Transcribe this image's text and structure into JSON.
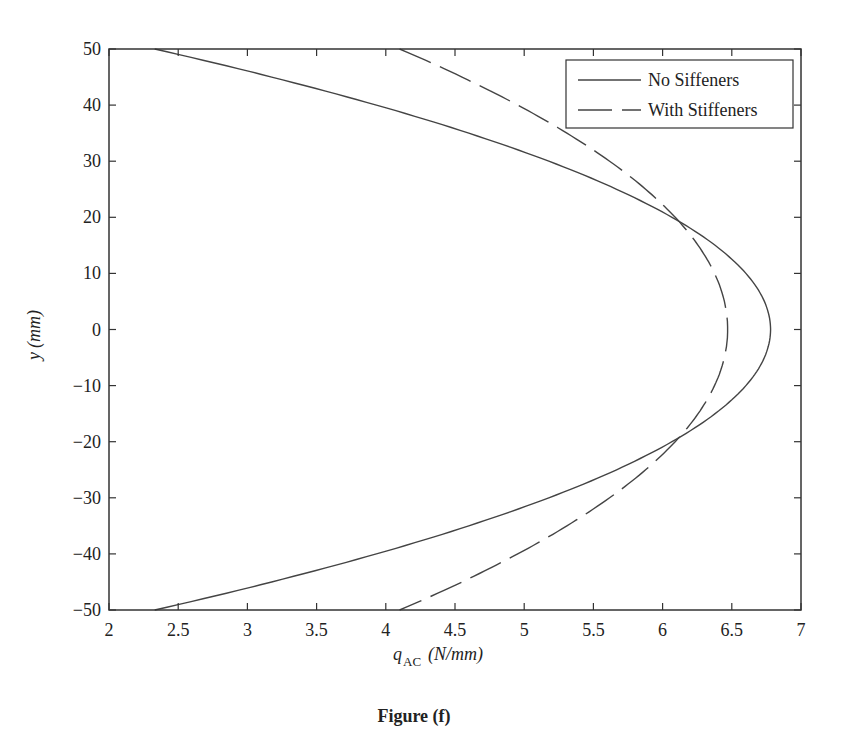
{
  "chart_data": {
    "type": "line",
    "title": "",
    "caption": "Figure (f)",
    "xlabel_main": "q",
    "xlabel_sub": "AC",
    "xlabel_unit": "(N/mm)",
    "ylabel_main": "y",
    "ylabel_unit": "(mm)",
    "xlim": [
      2,
      7
    ],
    "ylim": [
      -50,
      50
    ],
    "xticks": [
      2,
      2.5,
      3,
      3.5,
      4,
      4.5,
      5,
      5.5,
      6,
      6.5,
      7
    ],
    "xtick_labels": [
      "2",
      "2.5",
      "3",
      "3.5",
      "4",
      "4.5",
      "5",
      "5.5",
      "6",
      "6.5",
      "7"
    ],
    "yticks": [
      -50,
      -40,
      -30,
      -20,
      -10,
      0,
      10,
      20,
      30,
      40,
      50
    ],
    "ytick_labels": [
      "−50",
      "−40",
      "−30",
      "−20",
      "−10",
      "0",
      "10",
      "20",
      "30",
      "40",
      "50"
    ],
    "grid": false,
    "legend_position": "upper right",
    "series": [
      {
        "name": "No Siffeners",
        "style": "solid",
        "y": [
          -50,
          -40,
          -30,
          -20,
          -10,
          0,
          10,
          20,
          30,
          40,
          50
        ],
        "x": [
          2.33,
          3.93,
          5.18,
          6.07,
          6.6,
          6.78,
          6.6,
          6.07,
          5.18,
          3.93,
          2.33
        ]
      },
      {
        "name": "With Stiffeners",
        "style": "dashed",
        "y": [
          -50,
          -40,
          -30,
          -20,
          -10,
          0,
          10,
          20,
          30,
          40,
          50
        ],
        "x": [
          4.1,
          4.95,
          5.62,
          6.09,
          6.38,
          6.47,
          6.38,
          6.09,
          5.62,
          4.95,
          4.1
        ]
      }
    ]
  }
}
